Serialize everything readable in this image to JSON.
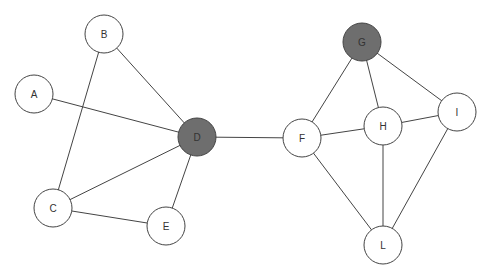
{
  "graph": {
    "colors": {
      "default_fill": "#ffffff",
      "highlight_fill": "#6e6e6e",
      "stroke": "#444444"
    },
    "nodes": [
      {
        "id": "A",
        "label": "A",
        "highlighted": false
      },
      {
        "id": "B",
        "label": "B",
        "highlighted": false
      },
      {
        "id": "C",
        "label": "C",
        "highlighted": false
      },
      {
        "id": "D",
        "label": "D",
        "highlighted": true
      },
      {
        "id": "E",
        "label": "E",
        "highlighted": false
      },
      {
        "id": "F",
        "label": "F",
        "highlighted": false
      },
      {
        "id": "G",
        "label": "G",
        "highlighted": true
      },
      {
        "id": "H",
        "label": "H",
        "highlighted": false
      },
      {
        "id": "I",
        "label": "I",
        "highlighted": false
      },
      {
        "id": "L",
        "label": "L",
        "highlighted": false
      }
    ],
    "edges": [
      [
        "A",
        "D"
      ],
      [
        "B",
        "D"
      ],
      [
        "B",
        "C"
      ],
      [
        "C",
        "D"
      ],
      [
        "C",
        "E"
      ],
      [
        "E",
        "D"
      ],
      [
        "D",
        "F"
      ],
      [
        "F",
        "G"
      ],
      [
        "F",
        "H"
      ],
      [
        "F",
        "L"
      ],
      [
        "G",
        "H"
      ],
      [
        "G",
        "I"
      ],
      [
        "H",
        "I"
      ],
      [
        "H",
        "L"
      ],
      [
        "I",
        "L"
      ]
    ]
  }
}
